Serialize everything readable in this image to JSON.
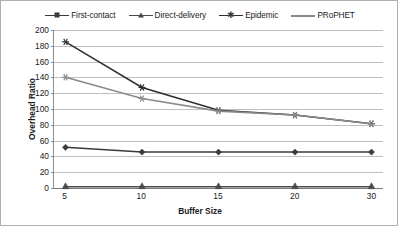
{
  "chart_data": {
    "type": "line",
    "title": "",
    "xlabel": "Buffer Size",
    "ylabel": "Overhead Ratio",
    "categories": [
      "5",
      "10",
      "15",
      "20",
      "30"
    ],
    "x": [
      5,
      10,
      15,
      20,
      30
    ],
    "ylim": [
      0,
      200
    ],
    "ytick_step": 20,
    "yticks": [
      "0",
      "20",
      "40",
      "60",
      "80",
      "100",
      "120",
      "140",
      "160",
      "180",
      "200"
    ],
    "grid": true,
    "legend_position": "top-center",
    "series": [
      {
        "name": "First-contact",
        "marker": "diamond",
        "color": "#3b3b3b",
        "values": [
          51,
          45,
          45,
          45,
          45
        ]
      },
      {
        "name": "Direct-delivery",
        "marker": "triangle",
        "color": "#4a4a4a",
        "values": [
          1,
          1,
          1,
          1,
          1
        ]
      },
      {
        "name": "Epidemic",
        "marker": "star",
        "color": "#2e2e2e",
        "values": [
          185,
          127,
          98,
          92,
          81
        ]
      },
      {
        "name": "PRoPHET",
        "marker": "star",
        "color": "#8a8a8a",
        "values": [
          140,
          113,
          97,
          92,
          81
        ]
      }
    ]
  },
  "legend": {
    "items": [
      {
        "label": "First-contact"
      },
      {
        "label": "Direct-delivery"
      },
      {
        "label": "Epidemic"
      },
      {
        "label": "PRoPHET"
      }
    ]
  },
  "colors": {
    "first_contact": "#3b3b3b",
    "direct_delivery": "#4a4a4a",
    "epidemic": "#2e2e2e",
    "prophet": "#8a8a8a",
    "gridline": "#bfbfbf",
    "axis": "#8c8c8c",
    "border": "#b0b0b0"
  }
}
